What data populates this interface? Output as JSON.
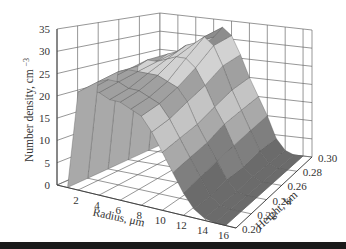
{
  "chart_data": {
    "type": "surface3d",
    "title": "",
    "xlabel": "Radius, μm",
    "ylabel": "Height, km",
    "zlabel": "Number density, cm⁻³",
    "x_ticks": [
      "2",
      "4",
      "6",
      "8",
      "10",
      "12",
      "14",
      "16"
    ],
    "y_ticks": [
      "0.20",
      "0.22",
      "0.24",
      "0.26",
      "0.28",
      "0.30"
    ],
    "z_ticks": [
      "0",
      "5",
      "10",
      "15",
      "20",
      "25",
      "30",
      "35"
    ],
    "xlim": [
      0,
      17
    ],
    "ylim": [
      0.2,
      0.3
    ],
    "zlim": [
      0,
      35
    ],
    "grid": true,
    "legend": "none",
    "contour_bands": [
      {
        "range": [
          0,
          5
        ],
        "color": "#6b6b6b"
      },
      {
        "range": [
          5,
          10
        ],
        "color": "#7f7f7f"
      },
      {
        "range": [
          10,
          15
        ],
        "color": "#a9a9a9"
      },
      {
        "range": [
          15,
          20
        ],
        "color": "#c4c4c4"
      },
      {
        "range": [
          20,
          25
        ],
        "color": "#a0a0a0"
      },
      {
        "range": [
          25,
          30
        ],
        "color": "#d2d2d2"
      },
      {
        "range": [
          30,
          35
        ],
        "color": "#8d8d8d"
      }
    ],
    "radius": [
      1,
      2,
      3,
      4,
      5,
      6,
      7,
      8,
      9,
      10,
      11,
      12,
      13,
      14,
      15,
      16
    ],
    "height_km": [
      0.2,
      0.22,
      0.24,
      0.26,
      0.28,
      0.3
    ],
    "density_profile_description": "Number density near 0 for radius < 1 μm, rising steeply to ~22–25 cm⁻³ at radius 2–3 μm, broad plateau ~22–26 across 3–8 μm with peaks up to ~33 cm⁻³ near radius 6–8 μm at the upper heights, decreasing to ~12–15 at radius 10–12 μm and near 0 beyond 13 μm.",
    "series": [
      {
        "name": "0.20 km",
        "values": [
          0,
          22,
          23,
          23,
          22,
          22,
          21,
          20,
          17,
          13,
          9,
          5,
          2,
          0.5,
          0,
          0
        ]
      },
      {
        "name": "0.22 km",
        "values": [
          0,
          23,
          24,
          24,
          23,
          23,
          22,
          21,
          18,
          14,
          10,
          6,
          2,
          0.5,
          0,
          0
        ]
      },
      {
        "name": "0.24 km",
        "values": [
          0,
          24,
          25,
          25,
          25,
          25,
          24,
          23,
          20,
          15,
          11,
          7,
          3,
          0.5,
          0,
          0
        ]
      },
      {
        "name": "0.26 km",
        "values": [
          0,
          24,
          26,
          26,
          27,
          28,
          28,
          26,
          22,
          17,
          13,
          8,
          3,
          1,
          0,
          0
        ]
      },
      {
        "name": "0.28 km",
        "values": [
          0,
          24,
          26,
          27,
          29,
          30,
          32,
          30,
          25,
          19,
          14,
          9,
          4,
          1,
          0,
          0
        ]
      },
      {
        "name": "0.30 km",
        "values": [
          0,
          23,
          25,
          26,
          28,
          30,
          33,
          31,
          26,
          20,
          15,
          10,
          4,
          1,
          0,
          0
        ]
      }
    ]
  }
}
